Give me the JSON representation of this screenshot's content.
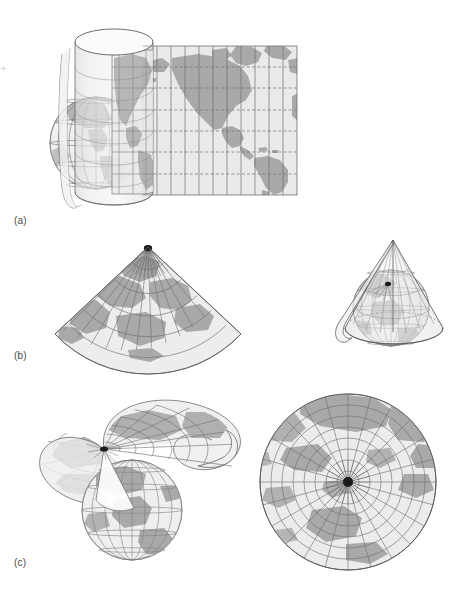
{
  "figure": {
    "caption_style": "lettered-panels",
    "background_color": "#ffffff"
  },
  "palette": {
    "ocean": "#e9e9e9",
    "land": "#a9a9a9",
    "land_dark": "#989898",
    "graticule": "#6f6f6f",
    "graticule_light": "#8d8d8d",
    "outline": "#5e5e5e",
    "surface_fill": "#f2f2f2",
    "pole_dot": "#1a1a1a",
    "label_color": "#4a4a4a"
  },
  "panels": [
    {
      "id": "a",
      "label": "(a)",
      "projection_family": "cylindrical",
      "items": [
        {
          "name": "globe-wireframe",
          "description": "graticule globe inside cylinder",
          "meridian_count": 12,
          "parallel_count": 7
        },
        {
          "name": "cylinder-surface",
          "description": "translucent cylinder tangent at equator, slit on left side"
        },
        {
          "name": "flat-map",
          "description": "unrolled rectangular world map of the Americas",
          "meridian_count": 11,
          "parallel_count": 7,
          "parallel_style": "dashed"
        }
      ]
    },
    {
      "id": "b",
      "label": "(b)",
      "projection_family": "conic",
      "items": [
        {
          "name": "unrolled-cone-map",
          "description": "semicircular fan map with radial meridians and arc parallels",
          "meridian_count": 24,
          "parallel_count": 6,
          "fan_sweep_degrees": 180
        },
        {
          "name": "cone-over-globe",
          "description": "translucent cone tangent along a standard parallel, apex above north pole"
        }
      ]
    },
    {
      "id": "c",
      "label": "(c)",
      "projection_family": "planar-azimuthal",
      "items": [
        {
          "name": "plane-over-globe",
          "description": "tangent plane at north pole shown in perspective, curled edge"
        },
        {
          "name": "flat-azimuthal-map",
          "description": "circular polar map, radial meridians converging at pole",
          "meridian_count": 24,
          "parallel_count": 8
        }
      ]
    }
  ]
}
